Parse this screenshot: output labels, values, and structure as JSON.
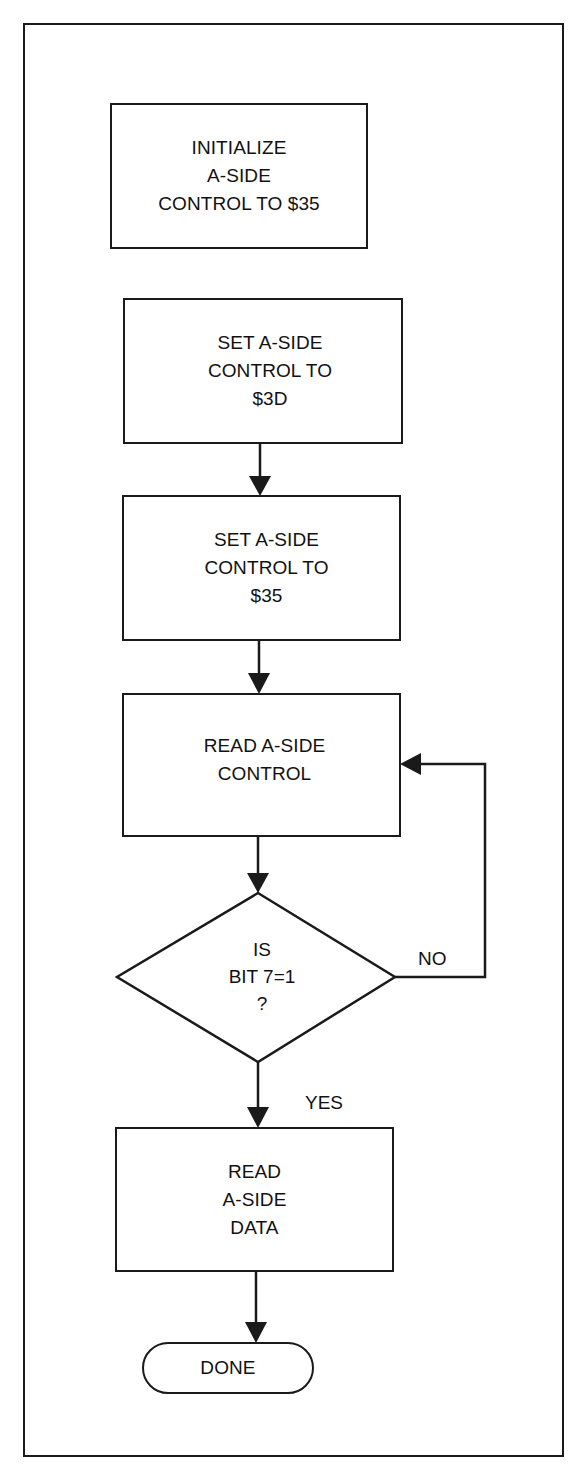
{
  "diagram": {
    "type": "flowchart",
    "nodes": [
      {
        "id": "init",
        "shape": "process",
        "lines": [
          "INITIALIZE",
          "A-SIDE",
          "CONTROL TO $35"
        ]
      },
      {
        "id": "set3d",
        "shape": "process",
        "lines": [
          "SET A-SIDE",
          "CONTROL TO",
          "$3D"
        ]
      },
      {
        "id": "set35",
        "shape": "process",
        "lines": [
          "SET A-SIDE",
          "CONTROL TO",
          "$35"
        ]
      },
      {
        "id": "readctl",
        "shape": "process",
        "lines": [
          "READ A-SIDE",
          "CONTROL"
        ]
      },
      {
        "id": "bit7",
        "shape": "decision",
        "lines": [
          "IS",
          "BIT 7=1",
          "?"
        ]
      },
      {
        "id": "readdata",
        "shape": "process",
        "lines": [
          "READ",
          "A-SIDE",
          "DATA"
        ]
      },
      {
        "id": "done",
        "shape": "terminator",
        "lines": [
          "DONE"
        ]
      }
    ],
    "edges": [
      {
        "from": "set3d",
        "to": "set35",
        "label": ""
      },
      {
        "from": "set35",
        "to": "readctl",
        "label": ""
      },
      {
        "from": "readctl",
        "to": "bit7",
        "label": ""
      },
      {
        "from": "bit7",
        "to": "readctl",
        "label": "NO"
      },
      {
        "from": "bit7",
        "to": "readdata",
        "label": "YES"
      },
      {
        "from": "readdata",
        "to": "done",
        "label": ""
      }
    ],
    "labels": {
      "no": "NO",
      "yes": "YES"
    }
  },
  "colors": {
    "ink": "#1a1a1a",
    "paper": "#ffffff"
  }
}
